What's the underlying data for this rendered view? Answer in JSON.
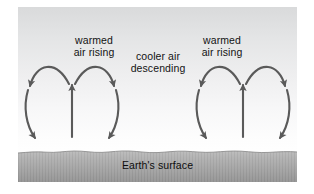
{
  "figure": {
    "type": "convection-diagram",
    "title_visible": false,
    "background": {
      "page": "#ffffff",
      "sky_top": "#d9dadb",
      "sky_bottom": "#ffffff",
      "ground_top": "#b7b7b7",
      "ground_bottom": "#9a9a9a",
      "arrow_color": "#5a5a5a"
    },
    "labels": {
      "warmed_left": "warmed\nair rising",
      "cooler_center": "cooler air\ndescending",
      "warmed_right": "warmed\nair rising",
      "ground": "Earth's surface"
    },
    "flow": {
      "rising_columns": 2,
      "descending_columns": 3,
      "cells": 4,
      "rising_arrow_direction": "up",
      "descending_arrow_direction": "down",
      "top_arc_direction": "outward"
    }
  }
}
